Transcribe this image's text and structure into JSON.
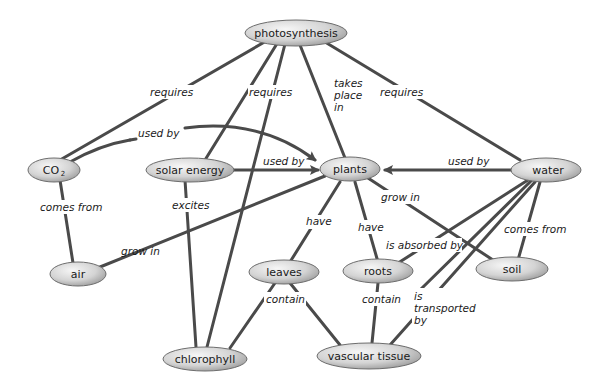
{
  "diagram": {
    "nodes": {
      "photosynthesis": "photosynthesis",
      "co2": "CO",
      "co2_sub": "2",
      "solar_energy": "solar energy",
      "plants": "plants",
      "water": "water",
      "air": "air",
      "leaves": "leaves",
      "roots": "roots",
      "soil": "soil",
      "chlorophyll": "chlorophyll",
      "vascular_tissue": "vascular tissue"
    },
    "edges": {
      "photo_co2": "requires",
      "photo_solar": "requires",
      "photo_plants_1": "takes",
      "photo_plants_2": "place",
      "photo_plants_3": "in",
      "photo_water": "requires",
      "co2_plants": "used by",
      "solar_plants": "used by",
      "water_plants": "used by",
      "co2_air": "comes from",
      "solar_chlorophyll": "excites",
      "plants_air": "grow in",
      "plants_leaves": "have",
      "plants_roots": "have",
      "plants_soil": "grow in",
      "water_roots": "is absorbed by",
      "water_soil": "comes from",
      "leaves_contain": "contain",
      "roots_contain": "contain",
      "water_vascular_1": "is",
      "water_vascular_2": "transported",
      "water_vascular_3": "by"
    },
    "colors": {
      "edge": "#4a4a4a",
      "node_light": "#f2f2f2",
      "node_dark": "#a8a8a8"
    }
  }
}
